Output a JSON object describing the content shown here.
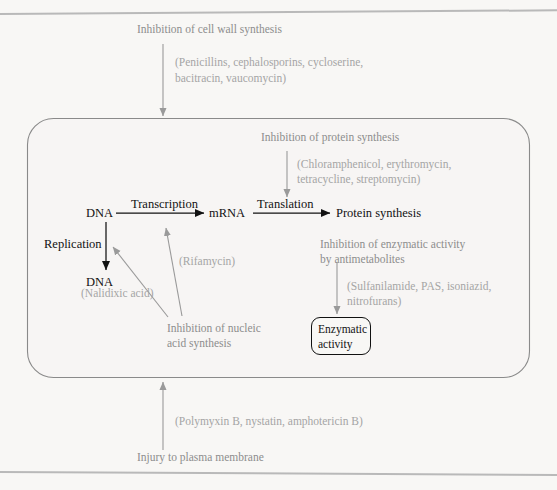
{
  "figure": {
    "colors": {
      "paper": "#f8f7f5",
      "ink_dark": "#121212",
      "ink_gray": "#8d8d8d",
      "ink_light_gray": "#a5a5a5",
      "cell_outline": "#8a8a8a",
      "rule": "#b9b9b9"
    }
  },
  "top_section": {
    "heading": "Inhibition of cell wall synthesis",
    "drugs_line1": "(Penicillins, cephalosporins, cycloserine,",
    "drugs_line2": "bacitracin, vaucomycin)"
  },
  "cell": {
    "protein_synthesis": {
      "heading": "Inhibition of protein synthesis",
      "drugs_line1": "(Chloramphenicol, erythromycin,",
      "drugs_line2": "tetracycline, streptomycin)"
    },
    "central_dogma": {
      "dna_top": "DNA",
      "transcription": "Transcription",
      "mrna": "mRNA",
      "translation": "Translation",
      "protein_synthesis": "Protein synthesis",
      "replication": "Replication",
      "dna_bottom": "DNA"
    },
    "nucleic_acid": {
      "rifamycin": "(Rifamycin)",
      "nalidixic": "(Nalidixic acid)",
      "heading_line1": "Inhibition of nucleic",
      "heading_line2": "acid synthesis"
    },
    "enzymatic": {
      "heading_line1": "Inhibition of enzymatic activity",
      "heading_line2": "by antimetabolites",
      "drugs_line1": "(Sulfanilamide, PAS, isoniazid,",
      "drugs_line2": "nitrofurans)",
      "box_line1": "Enzymatic",
      "box_line2": "activity"
    }
  },
  "bottom_section": {
    "drugs": "(Polymyxin B, nystatin, amphotericin B)",
    "heading": "Injury to plasma membrane"
  }
}
